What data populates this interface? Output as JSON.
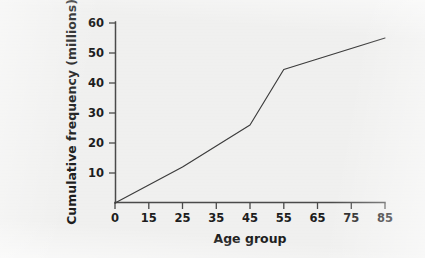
{
  "figure": {
    "background_color": "#f2f2f1",
    "ink_color": "#3c3c3c",
    "axis_color": "#4a4a4a"
  },
  "chart_data": {
    "type": "line",
    "title": "",
    "xlabel": "Age group",
    "ylabel": "Cumulative frequency (millions)",
    "categories": [
      "0",
      "15",
      "25",
      "35",
      "45",
      "55",
      "65",
      "75",
      "85"
    ],
    "x": [
      0,
      15,
      25,
      35,
      45,
      55,
      65,
      75,
      85
    ],
    "values": [
      0,
      6,
      12,
      19,
      26,
      44.5,
      48,
      51.5,
      55
    ],
    "series": [
      {
        "name": "Cumulative frequency",
        "values": [
          0,
          6,
          12,
          19,
          26,
          44.5,
          48,
          51.5,
          55
        ]
      }
    ],
    "xtick_labels": [
      "0",
      "15",
      "25",
      "35",
      "45",
      "55",
      "65",
      "75",
      "85"
    ],
    "ytick_labels": [
      "10",
      "20",
      "30",
      "40",
      "50",
      "60"
    ],
    "ytick_values": [
      10,
      20,
      30,
      40,
      50,
      60
    ],
    "ylim": [
      0,
      60
    ],
    "xlim": [
      0,
      85
    ],
    "x_axis_spacing": "categorical-even",
    "grid": false,
    "legend": "none",
    "markers": false,
    "annotations": []
  }
}
